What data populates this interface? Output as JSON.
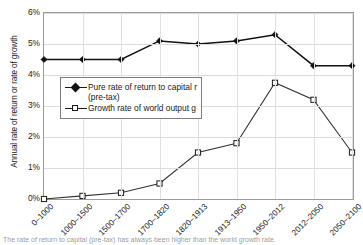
{
  "chart_data": {
    "type": "line",
    "title": "",
    "subtitle": "",
    "xlabel": "",
    "ylabel": "Annual rate of return or rate of growth",
    "categories": [
      "0–1000",
      "1000–1500",
      "1500–1700",
      "1700–1820",
      "1820–1913",
      "1913–1950",
      "1950–2012",
      "2012–2050",
      "2050–2100"
    ],
    "series": [
      {
        "name": "Pure rate of return to capital r (pre-tax)",
        "marker": "filled-diamond",
        "color": "#111111",
        "values": [
          4.5,
          4.5,
          4.5,
          5.1,
          5.0,
          5.1,
          5.3,
          4.3,
          4.3
        ]
      },
      {
        "name": "Growth rate of world output g",
        "marker": "open-square",
        "color": "#333333",
        "values": [
          0.0,
          0.1,
          0.2,
          0.5,
          1.5,
          1.8,
          3.75,
          3.2,
          1.5
        ]
      }
    ],
    "ylim": [
      0,
      6
    ],
    "yticks": [
      0,
      1,
      2,
      3,
      4,
      5,
      6
    ],
    "ytick_labels": [
      "0%",
      "1%",
      "2%",
      "3%",
      "4%",
      "5%",
      "6%"
    ],
    "grid": true,
    "legend_position": "inside-upper-left"
  },
  "legend": {
    "entries": [
      {
        "label_line1": "Pure rate of return to capital r",
        "label_line2": "(pre-tax)",
        "marker": "filled-diamond-marker"
      },
      {
        "label_line1": "Growth rate of world output g",
        "label_line2": "",
        "marker": "open-square-marker"
      }
    ]
  },
  "caption": {
    "text": "The rate of return to capital (pre-tax) has always been higher than the world growth rate."
  }
}
